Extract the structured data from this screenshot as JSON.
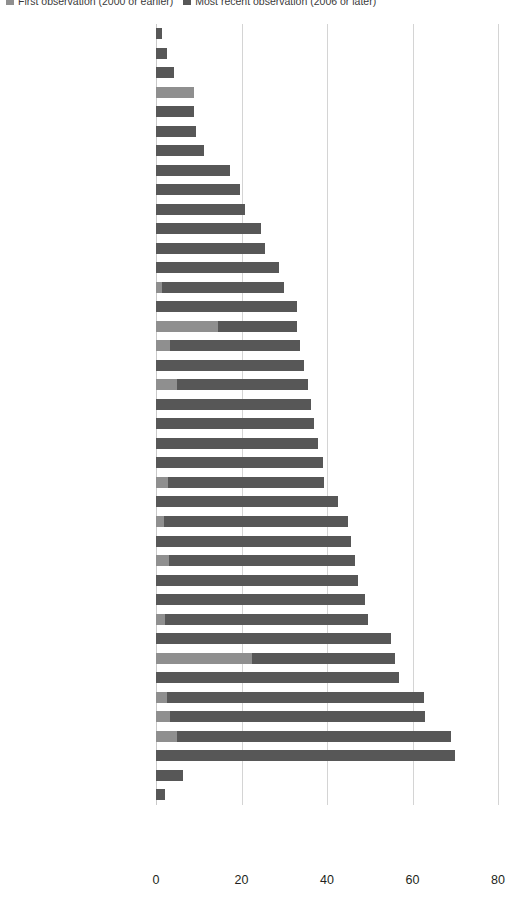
{
  "chart_data": {
    "type": "bar",
    "orientation": "horizontal",
    "stacked": true,
    "title": "",
    "subtitle": "",
    "xlabel": "",
    "ylabel": "",
    "xlim": [
      0,
      80
    ],
    "xticks": [
      0,
      20,
      40,
      60,
      80
    ],
    "grid": "vertical",
    "legend_position": "top-left",
    "colors": {
      "first_observation": "#8f8f8f",
      "most_recent_observation": "#575757",
      "gridline": "#d4d4d4"
    },
    "series": [
      {
        "name": "First observation (2000 or earlier)",
        "color": "#8f8f8f"
      },
      {
        "name": "Most recent observation (2006 or later)",
        "color": "#575757"
      }
    ],
    "categories": [
      "Swaziland",
      "Côte d’Ivoire",
      "Guinea",
      "Comoros",
      "Zimbabwe",
      "Chad",
      "Somalia",
      "Mozambique",
      "Benin",
      "Cameroon",
      "Sudan",
      "Angola",
      "Nigeria",
      "Sierra Leone",
      "Ethiopia",
      "Gambia, The",
      "Namibia",
      "Senegal",
      "Guinea-Bissau",
      "Central African Rep.",
      "Liberia",
      "Congo, Dem. Rep.",
      "Ghana",
      "Malawi",
      "Uganda",
      "Burundi",
      "Madagascar",
      "Kenya",
      "Burkina Faso",
      "Eritrea",
      "Zambia",
      "Gabon",
      "São Tomé and Príncipe",
      "Togo",
      "Tanzania",
      "Niger",
      "Rwanda",
      "Mali",
      "Congo, Rep. (2005)",
      "Mauritania (2004)"
    ],
    "rows": [
      {
        "category": "Swaziland",
        "first": 0.0,
        "recent": 1.5,
        "total": 1.5
      },
      {
        "category": "Côte d’Ivoire",
        "first": 0.0,
        "recent": 2.6,
        "total": 2.6
      },
      {
        "category": "Guinea",
        "first": 0.0,
        "recent": 4.3,
        "total": 4.3
      },
      {
        "category": "Comoros",
        "first": 8.8,
        "recent": 0.0,
        "total": 8.8
      },
      {
        "category": "Zimbabwe",
        "first": 0.0,
        "recent": 9.0,
        "total": 9.0
      },
      {
        "category": "Chad",
        "first": 0.0,
        "recent": 9.3,
        "total": 9.3
      },
      {
        "category": "Somalia",
        "first": 0.0,
        "recent": 11.2,
        "total": 11.2
      },
      {
        "category": "Mozambique",
        "first": 0.0,
        "recent": 17.2,
        "total": 17.2
      },
      {
        "category": "Benin",
        "first": 0.0,
        "recent": 19.6,
        "total": 19.6
      },
      {
        "category": "Cameroon",
        "first": 0.0,
        "recent": 20.8,
        "total": 20.8
      },
      {
        "category": "Sudan",
        "first": 0.0,
        "recent": 24.6,
        "total": 24.6
      },
      {
        "category": "Angola",
        "first": 0.0,
        "recent": 25.4,
        "total": 25.4
      },
      {
        "category": "Nigeria",
        "first": 0.0,
        "recent": 28.8,
        "total": 28.8
      },
      {
        "category": "Sierra Leone",
        "first": 1.5,
        "recent": 28.5,
        "total": 30.0
      },
      {
        "category": "Ethiopia",
        "first": 0.0,
        "recent": 33.0,
        "total": 33.0
      },
      {
        "category": "Gambia, The",
        "first": 14.5,
        "recent": 18.6,
        "total": 33.1
      },
      {
        "category": "Namibia",
        "first": 3.2,
        "recent": 30.4,
        "total": 33.6
      },
      {
        "category": "Senegal",
        "first": 0.0,
        "recent": 34.6,
        "total": 34.6
      },
      {
        "category": "Guinea-Bissau",
        "first": 5.0,
        "recent": 30.5,
        "total": 35.5
      },
      {
        "category": "Central African Rep.",
        "first": 0.0,
        "recent": 36.2,
        "total": 36.2
      },
      {
        "category": "Liberia",
        "first": 0.0,
        "recent": 37.0,
        "total": 37.0
      },
      {
        "category": "Congo, Dem. Rep.",
        "first": 0.0,
        "recent": 38.0,
        "total": 38.0
      },
      {
        "category": "Ghana",
        "first": 0.0,
        "recent": 39.0,
        "total": 39.0
      },
      {
        "category": "Malawi",
        "first": 2.8,
        "recent": 36.5,
        "total": 39.3
      },
      {
        "category": "Uganda",
        "first": 0.0,
        "recent": 42.5,
        "total": 42.5
      },
      {
        "category": "Burundi",
        "first": 1.8,
        "recent": 43.2,
        "total": 45.0
      },
      {
        "category": "Madagascar",
        "first": 0.0,
        "recent": 45.5,
        "total": 45.5
      },
      {
        "category": "Kenya",
        "first": 3.0,
        "recent": 43.5,
        "total": 46.5
      },
      {
        "category": "Burkina Faso",
        "first": 0.0,
        "recent": 47.2,
        "total": 47.2
      },
      {
        "category": "Eritrea",
        "first": 0.0,
        "recent": 48.8,
        "total": 48.8
      },
      {
        "category": "Zambia",
        "first": 2.0,
        "recent": 47.5,
        "total": 49.5
      },
      {
        "category": "Gabon",
        "first": 0.0,
        "recent": 55.0,
        "total": 55.0
      },
      {
        "category": "São Tomé and Príncipe",
        "first": 22.4,
        "recent": 33.4,
        "total": 55.8
      },
      {
        "category": "Togo",
        "first": 0.0,
        "recent": 56.8,
        "total": 56.8
      },
      {
        "category": "Tanzania",
        "first": 2.5,
        "recent": 60.2,
        "total": 62.7
      },
      {
        "category": "Niger",
        "first": 3.2,
        "recent": 59.8,
        "total": 63.0
      },
      {
        "category": "Rwanda",
        "first": 5.0,
        "recent": 64.0,
        "total": 69.0
      },
      {
        "category": "Mali",
        "first": 0.0,
        "recent": 70.0,
        "total": 70.0
      },
      {
        "category": "Congo, Rep. (2005)",
        "first": 0.0,
        "recent": 6.2,
        "total": 6.2
      },
      {
        "category": "Mauritania (2004)",
        "first": 0.0,
        "recent": 2.2,
        "total": 2.2
      }
    ]
  },
  "legend": {
    "entries": [
      {
        "label": "First observation (2000 or earlier)",
        "color": "#8f8f8f"
      },
      {
        "label": "Most recent observation (2006 or later)",
        "color": "#575757"
      }
    ]
  },
  "axis": {
    "x_ticks": [
      "0",
      "20",
      "40",
      "60",
      "80"
    ]
  }
}
